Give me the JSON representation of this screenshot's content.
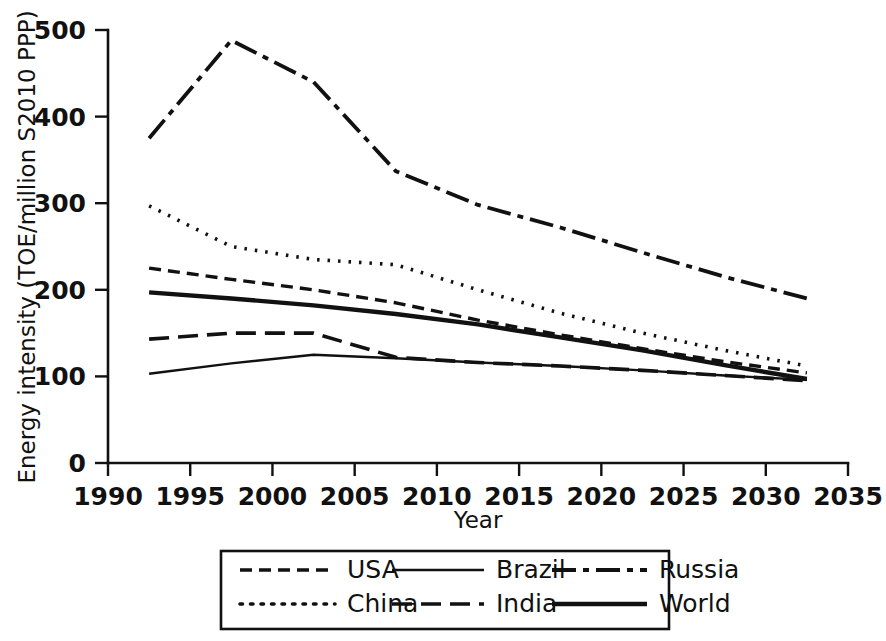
{
  "chart_data": {
    "type": "line",
    "title": "",
    "xlabel": "Year",
    "ylabel": "Energy intensity (TOE/million S2010 PPP)",
    "xlim": [
      1990,
      2035
    ],
    "ylim": [
      0,
      500
    ],
    "xticks": [
      "1990",
      "1995",
      "2000",
      "2005",
      "2010",
      "2015",
      "2020",
      "2025",
      "2030",
      "2035"
    ],
    "yticks": [
      "0",
      "100",
      "200",
      "300",
      "400",
      "500"
    ],
    "grid": false,
    "legend_position": "bottom",
    "x": [
      1992.5,
      1997.5,
      2002.5,
      2007.5,
      2012.5,
      2017.5,
      2022.5,
      2027.5,
      2032.5
    ],
    "series": [
      {
        "name": "USA",
        "dash": "12,7",
        "width": 3.4,
        "values": [
          225,
          212,
          200,
          185,
          165,
          148,
          132,
          117,
          104
        ]
      },
      {
        "name": "China",
        "dash": "2.5,8",
        "width": 3.6,
        "values": [
          297,
          250,
          235,
          229,
          200,
          173,
          150,
          130,
          112
        ]
      },
      {
        "name": "Brazil",
        "dash": "none",
        "width": 2.4,
        "values": [
          103,
          115,
          125,
          121,
          116,
          112,
          107,
          101,
          96
        ]
      },
      {
        "name": "India",
        "dash": "20,9",
        "width": 3.6,
        "values": [
          143,
          150,
          150,
          122,
          116,
          112,
          107,
          101,
          95
        ]
      },
      {
        "name": "Russia",
        "dash": "24,7,6,7",
        "width": 3.8,
        "values": [
          375,
          488,
          440,
          337,
          298,
          272,
          243,
          215,
          190
        ]
      },
      {
        "name": "World",
        "dash": "none",
        "width": 4.4,
        "values": [
          197,
          190,
          182,
          172,
          160,
          145,
          130,
          113,
          97
        ]
      }
    ]
  },
  "legend": {
    "entries": [
      {
        "label": "USA",
        "dash": "12,7",
        "width": 3.4
      },
      {
        "label": "China",
        "dash": "2.5,8",
        "width": 3.6
      },
      {
        "label": "Brazil",
        "dash": "none",
        "width": 2.4
      },
      {
        "label": "India",
        "dash": "20,9",
        "width": 3.6
      },
      {
        "label": "Russia",
        "dash": "24,7,6,7",
        "width": 3.8
      },
      {
        "label": "World",
        "dash": "none",
        "width": 4.4
      }
    ]
  },
  "colors": {
    "ink": "#111111",
    "background": "#ffffff"
  }
}
